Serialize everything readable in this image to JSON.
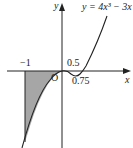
{
  "diagram": {
    "type": "function-graph",
    "equation_label": "y = 4x³ − 3x",
    "axis_labels": {
      "x": "x",
      "y": "y"
    },
    "origin_label": "O",
    "tick_labels": [
      "−1",
      "0.5",
      "0.75"
    ],
    "shaded_region": "between curve and x-axis from x = −1 to x = 0",
    "colors": {
      "curve": "#222222",
      "axes": "#222222",
      "shade": "#a6a6a6",
      "background": "#ffffff"
    }
  }
}
